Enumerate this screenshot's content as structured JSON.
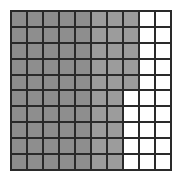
{
  "figure": {
    "type": "hundred-grid",
    "rows": 10,
    "cols": 10,
    "shaded_per_row": [
      8,
      8,
      8,
      8,
      8,
      7,
      7,
      7,
      7,
      7
    ],
    "shaded_total": 75,
    "total_cells": 100,
    "colors": {
      "shaded": "#8e8e8e",
      "shaded_light": "#9c9c9c",
      "unshaded": "#ffffff",
      "grid_line": "#2a2a2a"
    }
  }
}
